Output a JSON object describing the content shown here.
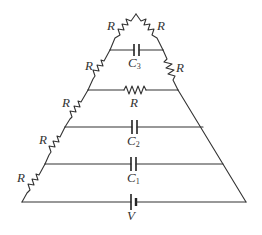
{
  "diagram": {
    "type": "circuit",
    "colors": {
      "wire": "#333333",
      "background": "#ffffff"
    },
    "labels": {
      "r_apex_left": "R",
      "r_apex_right": "R",
      "c3": "C",
      "c3_sub": "3",
      "r_left_2": "R",
      "r_right_2": "R",
      "r_middle": "R",
      "r_left_3": "R",
      "c2": "C",
      "c2_sub": "2",
      "r_left_4": "R",
      "c1": "C",
      "c1_sub": "1",
      "r_left_5": "R",
      "battery": "V"
    },
    "components": [
      {
        "type": "resistor",
        "label": "R",
        "position": "left edge, apex to C3 rung"
      },
      {
        "type": "resistor",
        "label": "R",
        "position": "right edge, apex to C3 rung"
      },
      {
        "type": "capacitor",
        "label": "C3",
        "position": "top rung"
      },
      {
        "type": "resistor",
        "label": "R",
        "position": "left edge, C3 rung to R rung"
      },
      {
        "type": "resistor",
        "label": "R",
        "position": "right edge, C3 rung to R rung"
      },
      {
        "type": "resistor",
        "label": "R",
        "position": "second rung"
      },
      {
        "type": "resistor",
        "label": "R",
        "position": "left edge, R rung to C2 rung"
      },
      {
        "type": "capacitor",
        "label": "C2",
        "position": "third rung"
      },
      {
        "type": "resistor",
        "label": "R",
        "position": "left edge, C2 rung to C1 rung"
      },
      {
        "type": "capacitor",
        "label": "C1",
        "position": "fourth rung"
      },
      {
        "type": "resistor",
        "label": "R",
        "position": "left edge, C1 rung to bottom"
      },
      {
        "type": "battery",
        "label": "V",
        "position": "bottom rung"
      }
    ]
  }
}
